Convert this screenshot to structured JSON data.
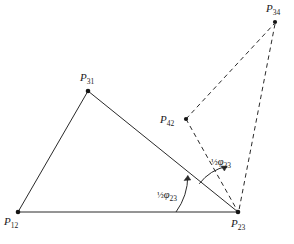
{
  "figure": {
    "type": "geometric-diagram",
    "background_color": "#ffffff",
    "stroke_color": "#1a1a1a",
    "width": 294,
    "height": 244,
    "points": [
      {
        "id": "p12",
        "label_base": "P",
        "label_sub": "12",
        "x": 18,
        "y": 212,
        "label_x": 4,
        "label_y": 216,
        "marker": "dot"
      },
      {
        "id": "p31",
        "label_base": "P",
        "label_sub": "31",
        "x": 88,
        "y": 91,
        "label_x": 80,
        "label_y": 72,
        "marker": "dot"
      },
      {
        "id": "p23",
        "label_base": "P",
        "label_sub": "23",
        "x": 238,
        "y": 212,
        "label_x": 231,
        "label_y": 218,
        "marker": "dot"
      },
      {
        "id": "p42",
        "label_base": "P",
        "label_sub": "42",
        "x": 186,
        "y": 119,
        "label_x": 160,
        "label_y": 114,
        "marker": "dot"
      },
      {
        "id": "p34",
        "label_base": "P",
        "label_sub": "34",
        "x": 275,
        "y": 22,
        "label_x": 266,
        "label_y": 3,
        "marker": "dot"
      }
    ],
    "solid_edges": [
      {
        "id": "edge-p12-p31",
        "from": "p12",
        "to": "p31"
      },
      {
        "id": "edge-p31-p23",
        "from": "p31",
        "to": "p23"
      },
      {
        "id": "edge-p12-p23",
        "from": "p12",
        "to": "p23"
      }
    ],
    "dashed_edges": [
      {
        "id": "edge-p42-p34",
        "from": "p42",
        "to": "p34"
      },
      {
        "id": "edge-p42-p23",
        "from": "p42",
        "to": "p23"
      },
      {
        "id": "edge-p34-p23",
        "from": "p34",
        "to": "p23"
      }
    ],
    "angle_annotations": [
      {
        "id": "angle-lower",
        "frac": "½",
        "symbol": "φ",
        "sub": "23",
        "label_x": 157,
        "label_y": 190,
        "vertex": "p23",
        "arc_radius": 62,
        "start_deg": 180,
        "end_deg": 216
      },
      {
        "id": "angle-upper",
        "frac": "½",
        "symbol": "φ",
        "sub": "23",
        "label_x": 211,
        "label_y": 157,
        "vertex": "p23",
        "arc_radius": 48,
        "start_deg": 216,
        "end_deg": 257
      }
    ]
  }
}
